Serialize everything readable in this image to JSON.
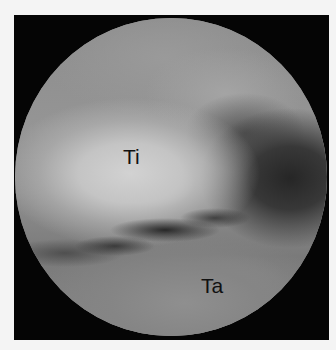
{
  "image": {
    "type": "arthroscopic-view",
    "background_color": "#f4f4f4",
    "frame_color": "#050505",
    "labels": [
      {
        "id": "ti",
        "text": "Ti"
      },
      {
        "id": "ta",
        "text": "Ta"
      }
    ]
  }
}
